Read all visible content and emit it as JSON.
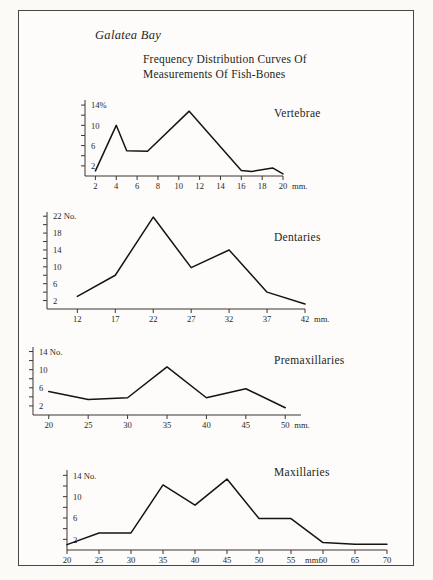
{
  "header": {
    "site_label": "Galatea Bay",
    "title_line1": "Frequency Distribution Curves Of",
    "title_line2": "Measurements Of Fish-Bones"
  },
  "chart_data": [
    {
      "type": "line",
      "name": "vertebrae",
      "title": "Vertebrae",
      "xlabel": "mm.",
      "ylabel": "14%",
      "y_unit": "%",
      "xlim": [
        1,
        20
      ],
      "ylim": [
        0,
        15
      ],
      "xticks": [
        2,
        4,
        6,
        8,
        10,
        12,
        14,
        16,
        18,
        20
      ],
      "xticklabels": [
        "2",
        "4",
        "6",
        "8",
        "10",
        "12",
        "14",
        "16",
        "18",
        "20"
      ],
      "yticks": [
        2,
        4,
        6,
        8,
        10,
        12,
        14
      ],
      "yticklabels": [
        "2",
        "",
        "6",
        "",
        "10",
        "",
        "14%"
      ],
      "x": [
        2,
        4,
        5,
        7,
        11,
        16,
        17,
        19,
        20
      ],
      "values": [
        1.0,
        10.0,
        5.0,
        4.9,
        12.8,
        1.1,
        0.9,
        1.6,
        0.4
      ],
      "grid": false
    },
    {
      "type": "line",
      "name": "dentaries",
      "title": "Dentaries",
      "xlabel": "mm.",
      "ylabel": "22 No.",
      "y_unit": "No.",
      "xlim": [
        8,
        42
      ],
      "ylim": [
        0,
        23
      ],
      "xticks": [
        12,
        17,
        22,
        27,
        32,
        37,
        42
      ],
      "xticklabels": [
        "12",
        "17",
        "22",
        "27",
        "32",
        "37",
        "42"
      ],
      "yticks": [
        2,
        4,
        6,
        8,
        10,
        12,
        14,
        16,
        18,
        20,
        22
      ],
      "yticklabels": [
        "2",
        "",
        "6",
        "",
        "10",
        "",
        "14",
        "",
        "18",
        "",
        "22 No."
      ],
      "x": [
        12,
        17,
        22,
        27,
        32,
        37,
        42
      ],
      "values": [
        3.0,
        8.0,
        21.8,
        9.8,
        14.0,
        4.0,
        1.2
      ],
      "grid": false
    },
    {
      "type": "line",
      "name": "premaxillaries",
      "title": "Premaxillaries",
      "xlabel": "mm.",
      "ylabel": "14 No.",
      "y_unit": "No.",
      "xlim": [
        18,
        52
      ],
      "ylim": [
        0,
        15
      ],
      "xticks": [
        20,
        25,
        30,
        35,
        40,
        45,
        50
      ],
      "xticklabels": [
        "20",
        "25",
        "30",
        "35",
        "40",
        "45",
        "50"
      ],
      "yticks": [
        2,
        4,
        6,
        8,
        10,
        12,
        14
      ],
      "yticklabels": [
        "2",
        "",
        "6",
        "",
        "10",
        "",
        "14 No."
      ],
      "x": [
        20,
        25,
        30,
        35,
        40,
        45,
        50
      ],
      "values": [
        5.2,
        3.4,
        3.8,
        10.6,
        3.8,
        5.8,
        1.6
      ],
      "grid": false
    },
    {
      "type": "line",
      "name": "maxillaries",
      "title": "Maxillaries",
      "xlabel": "mm.",
      "ylabel": "14 No.",
      "y_unit": "No.",
      "xlim": [
        20,
        70
      ],
      "ylim": [
        0,
        15
      ],
      "xticks": [
        20,
        25,
        30,
        35,
        40,
        45,
        50,
        55,
        60,
        65,
        70
      ],
      "xticklabels": [
        "20",
        "25",
        "30",
        "35",
        "40",
        "45",
        "50",
        "55",
        "60",
        "65",
        "70"
      ],
      "yticks": [
        2,
        4,
        6,
        8,
        10,
        12,
        14
      ],
      "yticklabels": [
        "2",
        "",
        "6",
        "",
        "10",
        "",
        "14 No."
      ],
      "x": [
        20,
        25,
        30,
        35,
        40,
        45,
        50,
        55,
        60,
        65,
        70
      ],
      "values": [
        1.0,
        3.2,
        3.2,
        12.2,
        8.4,
        13.3,
        5.9,
        5.9,
        1.4,
        1.1,
        1.1
      ],
      "unit_after_tick": "55",
      "grid": false
    }
  ]
}
